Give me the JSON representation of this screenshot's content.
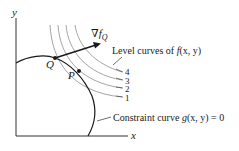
{
  "diagram": {
    "axes": {
      "x_label": "x",
      "y_label": "y"
    },
    "gradient_label": {
      "symbol": "∇f",
      "subscript": "Q"
    },
    "points": [
      {
        "name": "Q",
        "label": "Q"
      },
      {
        "name": "P",
        "label": "P"
      }
    ],
    "level_curves": {
      "caption_prefix": "Level curves of ",
      "caption_func": "f",
      "caption_args": "(x, y)",
      "labels": [
        "4",
        "3",
        "2",
        "1"
      ]
    },
    "constraint": {
      "caption_prefix": "Constraint curve ",
      "caption_func": "g",
      "caption_args": "(x, y) = 0"
    },
    "colors": {
      "ink": "#1a1a1a",
      "level_curve": "#9a9a9a",
      "axis": "#333333"
    }
  }
}
